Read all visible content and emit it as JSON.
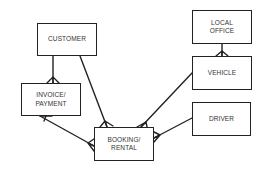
{
  "diagram": {
    "type": "entity-relationship",
    "line_color": "#222222",
    "entities": [
      {
        "id": "customer",
        "label": "CUSTOMER",
        "x": 37,
        "y": 23,
        "w": 60,
        "h": 33
      },
      {
        "id": "invoice",
        "label": "INVOICE/\nPAYMENT",
        "x": 21,
        "y": 83,
        "w": 60,
        "h": 33
      },
      {
        "id": "booking",
        "label": "BOOKING/\nRENTAL",
        "x": 94,
        "y": 127,
        "w": 60,
        "h": 34
      },
      {
        "id": "local_office",
        "label": "LOCAL\nOFFICE",
        "x": 192,
        "y": 10,
        "w": 60,
        "h": 34
      },
      {
        "id": "vehicle",
        "label": "VEHICLE",
        "x": 192,
        "y": 56,
        "w": 60,
        "h": 34
      },
      {
        "id": "driver",
        "label": "DRIVER",
        "x": 192,
        "y": 102,
        "w": 59,
        "h": 34
      }
    ],
    "relationships": [
      {
        "from": "customer",
        "to": "invoice",
        "cardinality": "one-to-many"
      },
      {
        "from": "customer",
        "to": "booking",
        "cardinality": "one-to-many"
      },
      {
        "from": "invoice",
        "to": "booking",
        "cardinality": "many-to-many"
      },
      {
        "from": "local_office",
        "to": "vehicle",
        "cardinality": "one-to-many"
      },
      {
        "from": "vehicle",
        "to": "booking",
        "cardinality": "one-to-many"
      },
      {
        "from": "driver",
        "to": "booking",
        "cardinality": "one-to-many"
      }
    ]
  }
}
